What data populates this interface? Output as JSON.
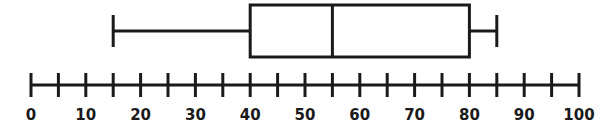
{
  "figure": {
    "name": "box-and-whisker-plot",
    "background_color": "#ffffff",
    "line_color": "#1a1a1a",
    "line_width": 3
  },
  "chart_data": {
    "type": "box",
    "title": "",
    "xlabel": "",
    "ylabel": "",
    "orientation": "horizontal",
    "xlim": [
      0,
      100
    ],
    "grid": false,
    "legend": null,
    "axis": {
      "min": 0,
      "max": 100,
      "major_tick_step": 10,
      "minor_tick_step": 5,
      "tick_values": [
        0,
        5,
        10,
        15,
        20,
        25,
        30,
        35,
        40,
        45,
        50,
        55,
        60,
        65,
        70,
        75,
        80,
        85,
        90,
        95,
        100
      ],
      "tick_labels": [
        "0",
        "",
        "10",
        "",
        "20",
        "",
        "30",
        "",
        "40",
        "",
        "50",
        "",
        "60",
        "",
        "70",
        "",
        "80",
        "",
        "90",
        "",
        "100"
      ],
      "labeled_tick_values": [
        0,
        10,
        20,
        30,
        40,
        50,
        60,
        70,
        80,
        90,
        100
      ],
      "labeled_tick_texts": [
        "0",
        "10",
        "20",
        "30",
        "40",
        "50",
        "60",
        "70",
        "80",
        "90",
        "100"
      ]
    },
    "boxes": [
      {
        "name": "series-1",
        "min": 15,
        "q1": 40,
        "median": 55,
        "q3": 80,
        "max": 85,
        "iqr": 40,
        "range": 70,
        "outliers": []
      }
    ],
    "summary_labels": {
      "min": "minimum",
      "q1": "first quartile",
      "median": "median",
      "q3": "third quartile",
      "max": "maximum"
    }
  },
  "geometry": {
    "x_at_zero": 31,
    "px_per_unit": 5.48,
    "box_top": 5,
    "box_bottom": 57,
    "whisker_y": 31,
    "cap_top": 15,
    "cap_bottom": 47,
    "axis_y": 85,
    "tick_top": 73,
    "tick_bottom": 97,
    "label_baseline": 120
  }
}
